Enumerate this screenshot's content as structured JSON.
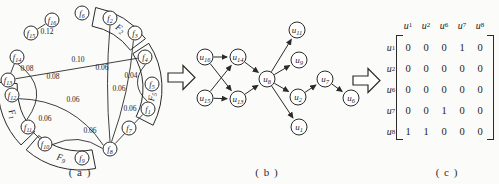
{
  "captions": {
    "a": "( a )",
    "b": "( b )",
    "c": "( c )"
  },
  "icons": {
    "arrow_a_to_b": "right-block-arrow",
    "arrow_b_to_c": "right-block-arrow"
  },
  "colors": {
    "ink": "#2a2a2a",
    "node_fill": "#ffffff",
    "background": "#fbfbfa"
  },
  "panel_a": {
    "center": {
      "x": 80,
      "y": 88
    },
    "ring": {
      "inner_radius": 63,
      "outer_radius": 82,
      "label_radius": 72
    },
    "node_radius": 7,
    "bands": [
      {
        "base": "F",
        "sub": "2",
        "a1": -79,
        "a2": -37,
        "label_angle": -56
      },
      {
        "base": "F",
        "sub": "5",
        "a1": -33,
        "a2": 27,
        "label_angle": 7
      },
      {
        "base": "F",
        "sub": "9",
        "a1": 79,
        "a2": 131,
        "label_angle": 105
      },
      {
        "base": "F",
        "sub": "1",
        "a1": 136,
        "a2": 184,
        "label_angle": 159
      }
    ],
    "nodes": [
      {
        "id": "f16",
        "base": "f",
        "sub": "16",
        "x": 52,
        "y": 20
      },
      {
        "id": "f15",
        "base": "f",
        "sub": "15",
        "x": 31,
        "y": 33
      },
      {
        "id": "f6",
        "base": "f",
        "sub": "6",
        "x": 82,
        "y": 13
      },
      {
        "id": "f2",
        "base": "f",
        "sub": "2",
        "x": 110,
        "y": 18
      },
      {
        "id": "f3",
        "base": "f",
        "sub": "3",
        "x": 135,
        "y": 33
      },
      {
        "id": "f4",
        "base": "f",
        "sub": "4",
        "x": 145,
        "y": 57
      },
      {
        "id": "f5",
        "base": "f",
        "sub": "5",
        "x": 152,
        "y": 84
      },
      {
        "id": "f1",
        "base": "f",
        "sub": "1",
        "x": 148,
        "y": 109
      },
      {
        "id": "f7",
        "base": "f",
        "sub": "7",
        "x": 129,
        "y": 128
      },
      {
        "id": "f8",
        "base": "f",
        "sub": "8",
        "x": 110,
        "y": 149
      },
      {
        "id": "f9",
        "base": "f",
        "sub": "9",
        "x": 82,
        "y": 158
      },
      {
        "id": "f10",
        "base": "f",
        "sub": "10",
        "x": 45,
        "y": 144
      },
      {
        "id": "f11",
        "base": "f",
        "sub": "11",
        "x": 28,
        "y": 127
      },
      {
        "id": "f12",
        "base": "f",
        "sub": "12",
        "x": 12,
        "y": 95
      },
      {
        "id": "f13",
        "base": "f",
        "sub": "13",
        "x": 8,
        "y": 80
      },
      {
        "id": "f14",
        "base": "f",
        "sub": "14",
        "x": 17,
        "y": 57
      }
    ],
    "edges": [
      {
        "from": "f15",
        "to": "f16",
        "weight": "0.12",
        "lx": 47,
        "ly": 34,
        "curve": 0
      },
      {
        "from": "f13",
        "to": "f14",
        "weight": "0.08",
        "lx": 27,
        "ly": 71,
        "curve": 0
      },
      {
        "from": "f14",
        "to": "f11",
        "weight": "0.08",
        "lx": 53,
        "ly": 79,
        "curve": -28
      },
      {
        "from": "f13",
        "to": "f4",
        "weight": "0.10",
        "lx": 78,
        "ly": 62,
        "curve": 0
      },
      {
        "from": "f12",
        "to": "f8",
        "weight": "0.06",
        "lx": 73,
        "ly": 102,
        "curve": -25
      },
      {
        "from": "f11",
        "to": "f10",
        "weight": "0.06",
        "lx": 45,
        "ly": 121,
        "curve": 0
      },
      {
        "from": "f10",
        "to": "f8",
        "weight": "0.06",
        "lx": 90,
        "ly": 133,
        "curve": -14
      },
      {
        "from": "f2",
        "to": "f8",
        "weight": "0.06",
        "lx": 102,
        "ly": 70,
        "curve": 5
      },
      {
        "from": "f3",
        "to": "f8",
        "weight": "0.06",
        "lx": 119,
        "ly": 91,
        "curve": -7
      },
      {
        "from": "f4",
        "to": "f1",
        "weight": "0.04",
        "lx": 131,
        "ly": 78,
        "curve": 18
      },
      {
        "from": "f1",
        "to": "f8",
        "weight": "0.06",
        "lx": 130,
        "ly": 111,
        "curve": 0
      }
    ]
  },
  "panel_b": {
    "node_radius": 8,
    "nodes": [
      {
        "id": "u16",
        "base": "u",
        "sub": "16",
        "x": 205,
        "y": 57
      },
      {
        "id": "u14",
        "base": "u",
        "sub": "14",
        "x": 238,
        "y": 57
      },
      {
        "id": "u15",
        "base": "u",
        "sub": "15",
        "x": 205,
        "y": 98
      },
      {
        "id": "u13",
        "base": "u",
        "sub": "13",
        "x": 238,
        "y": 99
      },
      {
        "id": "u8",
        "base": "u",
        "sub": "8",
        "x": 267,
        "y": 79
      },
      {
        "id": "u11",
        "base": "u",
        "sub": "11",
        "x": 297,
        "y": 30
      },
      {
        "id": "u9",
        "base": "u",
        "sub": "9",
        "x": 299,
        "y": 60
      },
      {
        "id": "u2",
        "base": "u",
        "sub": "2",
        "x": 298,
        "y": 97
      },
      {
        "id": "u1",
        "base": "u",
        "sub": "1",
        "x": 299,
        "y": 127
      },
      {
        "id": "u7",
        "base": "u",
        "sub": "7",
        "x": 325,
        "y": 79
      },
      {
        "id": "u6",
        "base": "u",
        "sub": "6",
        "x": 351,
        "y": 98
      }
    ],
    "edges": [
      {
        "from": "u16",
        "to": "u14"
      },
      {
        "from": "u15",
        "to": "u13"
      },
      {
        "from": "u16",
        "to": "u13"
      },
      {
        "from": "u15",
        "to": "u14"
      },
      {
        "from": "u14",
        "to": "u8"
      },
      {
        "from": "u13",
        "to": "u8"
      },
      {
        "from": "u8",
        "to": "u11"
      },
      {
        "from": "u8",
        "to": "u9"
      },
      {
        "from": "u8",
        "to": "u2"
      },
      {
        "from": "u8",
        "to": "u1"
      },
      {
        "from": "u2",
        "to": "u7"
      },
      {
        "from": "u7",
        "to": "u6"
      }
    ]
  },
  "matrix": {
    "col_headers": [
      {
        "base": "u",
        "sub": "1"
      },
      {
        "base": "u",
        "sub": "2"
      },
      {
        "base": "u",
        "sub": "6"
      },
      {
        "base": "u",
        "sub": "7"
      },
      {
        "base": "u",
        "sub": "8"
      }
    ],
    "row_headers": [
      {
        "base": "u",
        "sub": "1"
      },
      {
        "base": "u",
        "sub": "2"
      },
      {
        "base": "u",
        "sub": "6"
      },
      {
        "base": "u",
        "sub": "7"
      },
      {
        "base": "u",
        "sub": "8"
      }
    ],
    "rows": [
      [
        0,
        0,
        0,
        1,
        0
      ],
      [
        0,
        0,
        0,
        0,
        0
      ],
      [
        0,
        0,
        0,
        0,
        0
      ],
      [
        0,
        0,
        1,
        0,
        0
      ],
      [
        1,
        1,
        0,
        0,
        0
      ]
    ]
  }
}
